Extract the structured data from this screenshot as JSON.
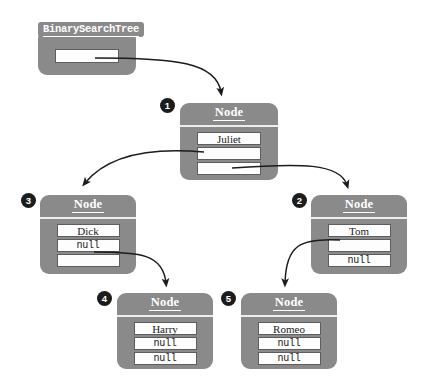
{
  "diagram": {
    "colors": {
      "object_fill": "#8a8a8a",
      "field_fill": "#fdfdfd",
      "field_border": "#5d5d5d",
      "badge_fill": "#1c1c1c",
      "badge_text": "#ffffff",
      "arrow": "#1c1c1c",
      "page_background": "#ffffff"
    },
    "root_variable": {
      "label": "BinarySearchTree",
      "field_value": ""
    },
    "node_type_label": "Node",
    "null_text": "null",
    "nodes": [
      {
        "badge": "1",
        "type": "Node",
        "fields": [
          {
            "value": "Juliet",
            "kind": "text"
          },
          {
            "value": "",
            "kind": "reference"
          },
          {
            "value": "",
            "kind": "reference"
          }
        ]
      },
      {
        "badge": "3",
        "type": "Node",
        "fields": [
          {
            "value": "Dick",
            "kind": "text"
          },
          {
            "value": "null",
            "kind": "null"
          },
          {
            "value": "",
            "kind": "reference"
          }
        ]
      },
      {
        "badge": "2",
        "type": "Node",
        "fields": [
          {
            "value": "Tom",
            "kind": "text"
          },
          {
            "value": "",
            "kind": "reference"
          },
          {
            "value": "null",
            "kind": "null"
          }
        ]
      },
      {
        "badge": "4",
        "type": "Node",
        "fields": [
          {
            "value": "Harry",
            "kind": "text"
          },
          {
            "value": "null",
            "kind": "null"
          },
          {
            "value": "null",
            "kind": "null"
          }
        ]
      },
      {
        "badge": "5",
        "type": "Node",
        "fields": [
          {
            "value": "Romeo",
            "kind": "text"
          },
          {
            "value": "null",
            "kind": "null"
          },
          {
            "value": "null",
            "kind": "null"
          }
        ]
      }
    ],
    "edges": [
      {
        "from": "root_variable",
        "to": "node-1"
      },
      {
        "from": "node-1-field-2",
        "to": "node-3"
      },
      {
        "from": "node-1-field-3",
        "to": "node-2"
      },
      {
        "from": "node-3-field-3",
        "to": "node-4"
      },
      {
        "from": "node-2-field-2",
        "to": "node-5"
      }
    ]
  }
}
